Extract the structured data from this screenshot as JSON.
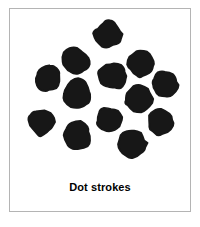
{
  "figure": {
    "caption": "Dot strokes",
    "background_color": "#ffffff",
    "border_color": "#b4b4b4",
    "ink_color": "#171717",
    "stroke_type": "dot",
    "dot_count": 13
  },
  "chart_data": {
    "type": "scatter",
    "title": "Dot strokes",
    "xlabel": "",
    "ylabel": "",
    "xlim": [
      0,
      180
    ],
    "ylim": [
      0,
      165
    ],
    "grid": false,
    "legend": "none",
    "marker_color": "#171717",
    "marker_shape": "irregular-filled-blob",
    "series": [
      {
        "name": "Dot strokes",
        "points": [
          {
            "x": 98,
            "y": 25,
            "r": 14
          },
          {
            "x": 66,
            "y": 52,
            "r": 14
          },
          {
            "x": 38,
            "y": 70,
            "r": 13
          },
          {
            "x": 102,
            "y": 67,
            "r": 14
          },
          {
            "x": 131,
            "y": 55,
            "r": 14
          },
          {
            "x": 67,
            "y": 85,
            "r": 14
          },
          {
            "x": 154,
            "y": 76,
            "r": 13
          },
          {
            "x": 129,
            "y": 90,
            "r": 14
          },
          {
            "x": 32,
            "y": 113,
            "r": 14
          },
          {
            "x": 100,
            "y": 111,
            "r": 14
          },
          {
            "x": 150,
            "y": 114,
            "r": 13
          },
          {
            "x": 68,
            "y": 127,
            "r": 14
          },
          {
            "x": 122,
            "y": 134,
            "r": 14
          }
        ]
      }
    ]
  }
}
